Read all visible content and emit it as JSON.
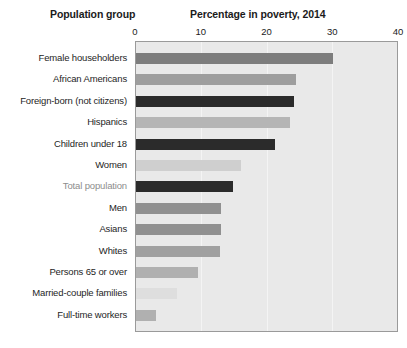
{
  "headers": {
    "left": "Population group",
    "right": "Percentage in poverty, 2014"
  },
  "chart_data": {
    "type": "bar",
    "orientation": "horizontal",
    "title": "Percentage in poverty, 2014",
    "xlabel": "Percentage in poverty, 2014",
    "ylabel": "Population group",
    "xlim": [
      0,
      40
    ],
    "ticks": [
      "0",
      "10",
      "20",
      "30",
      "40"
    ],
    "tick_values": [
      0,
      10,
      20,
      30,
      40
    ],
    "grid": true,
    "grid_axis": "x",
    "legend": "none",
    "plot_background": "#e9e9e9",
    "categories": [
      "Female householders",
      "African Americans",
      "Foreign-born (not citizens)",
      "Hispanics",
      "Children under 18",
      "Women",
      "Total population",
      "Men",
      "Asians",
      "Whites",
      "Persons 65 or over",
      "Married-couple families",
      "Full-time workers"
    ],
    "values": [
      30.0,
      24.3,
      24.0,
      23.4,
      21.2,
      16.0,
      14.8,
      13.0,
      12.9,
      12.7,
      9.5,
      6.2,
      3.0
    ],
    "bar_colors": [
      "#7d7d7d",
      "#9e9e9e",
      "#2b2b2b",
      "#b5b5b5",
      "#2b2b2b",
      "#cfcfcf",
      "#2b2b2b",
      "#909090",
      "#909090",
      "#a0a0a0",
      "#b0b0b0",
      "#dedede",
      "#b0b0b0"
    ],
    "label_colors": [
      "#252525",
      "#252525",
      "#252525",
      "#252525",
      "#252525",
      "#252525",
      "#8d8d8d",
      "#252525",
      "#252525",
      "#252525",
      "#252525",
      "#252525",
      "#252525"
    ],
    "highlighted_category": "Total population"
  }
}
